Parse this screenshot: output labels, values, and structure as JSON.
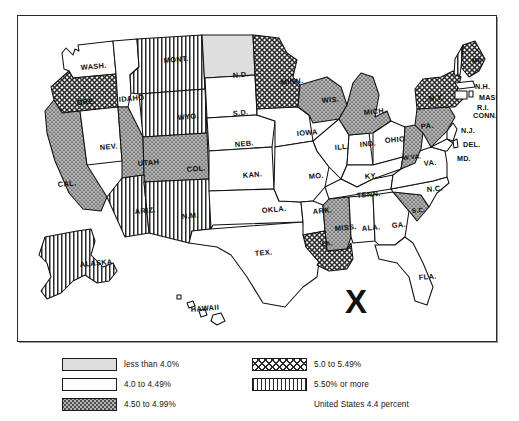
{
  "map": {
    "title": "United States unemployment rate map by state",
    "annotation_mark": "X",
    "national_note": "United States 4.4 percent"
  },
  "legend": {
    "items": [
      {
        "key": "lt40",
        "label": "less than 4.0%",
        "pattern": "light-gray-solid",
        "color": "#dcdcdc"
      },
      {
        "key": "40_449",
        "label": "4.0 to 4.49%",
        "pattern": "white-solid",
        "color": "#ffffff"
      },
      {
        "key": "450_499",
        "label": "4.50 to 4.99%",
        "pattern": "stipple-gray",
        "color": "#9d9d9d"
      },
      {
        "key": "50_549",
        "label": "5.0 to 5.49%",
        "pattern": "crosshatch",
        "color": "#3a3a3a"
      },
      {
        "key": "550up",
        "label": "5.50% or more",
        "pattern": "vertical-stripes",
        "color": "#2e2e2e"
      }
    ],
    "footnote": "United States 4.4 percent"
  },
  "states": [
    {
      "abbr": "WASH.",
      "cls": "40_449",
      "x": 64,
      "y": 55
    },
    {
      "abbr": "ORE.",
      "cls": "50_549",
      "x": 60,
      "y": 90
    },
    {
      "abbr": "CAL.",
      "cls": "450_499",
      "x": 41,
      "y": 172
    },
    {
      "abbr": "NEV.",
      "cls": "40_449",
      "x": 83,
      "y": 135
    },
    {
      "abbr": "IDAHO",
      "cls": "40_449",
      "x": 102,
      "y": 87
    },
    {
      "abbr": "MONT.",
      "cls": "550up",
      "x": 147,
      "y": 48
    },
    {
      "abbr": "WYO.",
      "cls": "550up",
      "x": 161,
      "y": 105
    },
    {
      "abbr": "UTAH",
      "cls": "450_499",
      "x": 121,
      "y": 151
    },
    {
      "abbr": "COL.",
      "cls": "450_499",
      "x": 170,
      "y": 157
    },
    {
      "abbr": "ARIZ.",
      "cls": "550up",
      "x": 118,
      "y": 199
    },
    {
      "abbr": "N.M.",
      "cls": "550up",
      "x": 165,
      "y": 204
    },
    {
      "abbr": "N.D.",
      "cls": "lt40",
      "x": 216,
      "y": 63
    },
    {
      "abbr": "S.D.",
      "cls": "40_449",
      "x": 216,
      "y": 101
    },
    {
      "abbr": "NEB.",
      "cls": "40_449",
      "x": 218,
      "y": 132
    },
    {
      "abbr": "KAN.",
      "cls": "40_449",
      "x": 226,
      "y": 163
    },
    {
      "abbr": "OKLA.",
      "cls": "40_449",
      "x": 245,
      "y": 198
    },
    {
      "abbr": "TEX.",
      "cls": "40_449",
      "x": 238,
      "y": 241
    },
    {
      "abbr": "MINN.",
      "cls": "50_549",
      "x": 264,
      "y": 70
    },
    {
      "abbr": "IOWA",
      "cls": "40_449",
      "x": 280,
      "y": 121
    },
    {
      "abbr": "MO.",
      "cls": "40_449",
      "x": 292,
      "y": 164
    },
    {
      "abbr": "ARK.",
      "cls": "40_449",
      "x": 296,
      "y": 199
    },
    {
      "abbr": "WIS.",
      "cls": "450_499",
      "x": 305,
      "y": 88
    },
    {
      "abbr": "ILL.",
      "cls": "40_449",
      "x": 318,
      "y": 135
    },
    {
      "abbr": "IND.",
      "cls": "40_449",
      "x": 343,
      "y": 132
    },
    {
      "abbr": "MICH.",
      "cls": "450_499",
      "x": 347,
      "y": 100
    },
    {
      "abbr": "OHIO",
      "cls": "40_449",
      "x": 368,
      "y": 128
    },
    {
      "abbr": "KY.",
      "cls": "40_449",
      "x": 348,
      "y": 164
    },
    {
      "abbr": "TENN.",
      "cls": "40_449",
      "x": 340,
      "y": 183
    },
    {
      "abbr": "MISS.",
      "cls": "450_499",
      "x": 318,
      "y": 216
    },
    {
      "abbr": "ALA.",
      "cls": "40_449",
      "x": 345,
      "y": 216
    },
    {
      "abbr": "GA.",
      "cls": "40_449",
      "x": 375,
      "y": 213
    },
    {
      "abbr": "LA.",
      "cls": "50_549",
      "x": 305,
      "y": 231
    },
    {
      "abbr": "FLA.",
      "cls": "40_449",
      "x": 402,
      "y": 265
    },
    {
      "abbr": "S.C.",
      "cls": "450_499",
      "x": 395,
      "y": 198
    },
    {
      "abbr": "N.C.",
      "cls": "40_449",
      "x": 410,
      "y": 177
    },
    {
      "abbr": "VA.",
      "cls": "40_449",
      "x": 407,
      "y": 151
    },
    {
      "abbr": "W.VA.",
      "cls": "450_499",
      "x": 386,
      "y": 145
    },
    {
      "abbr": "PA.",
      "cls": "450_499",
      "x": 404,
      "y": 114
    },
    {
      "abbr": "N.Y.",
      "cls": "50_549",
      "x": 412,
      "y": 86
    },
    {
      "abbr": "ME",
      "cls": "50_549",
      "x": 455,
      "y": 48
    },
    {
      "abbr": "N.H.",
      "cls": "550up",
      "x": 458,
      "y": 74
    },
    {
      "abbr": "MASS.",
      "cls": "40_449",
      "x": 462,
      "y": 85
    },
    {
      "abbr": "R.I.",
      "cls": "40_449",
      "x": 460,
      "y": 95
    },
    {
      "abbr": "CONN.",
      "cls": "40_449",
      "x": 456,
      "y": 103
    },
    {
      "abbr": "N.J.",
      "cls": "40_449",
      "x": 444,
      "y": 118
    },
    {
      "abbr": "DEL.",
      "cls": "40_449",
      "x": 446,
      "y": 132
    },
    {
      "abbr": "MD.",
      "cls": "40_449",
      "x": 440,
      "y": 146
    },
    {
      "abbr": "ALASKA",
      "cls": "550up",
      "x": 63,
      "y": 252
    },
    {
      "abbr": "HAWAII",
      "cls": "40_449",
      "x": 174,
      "y": 297
    }
  ]
}
